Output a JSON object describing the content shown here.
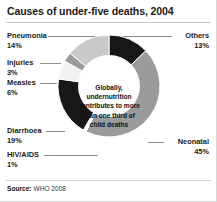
{
  "chart_data": {
    "type": "pie",
    "title": "Causes of under-five deaths, 2004",
    "subtitle": "",
    "xlabel": "",
    "ylabel": "",
    "donut": true,
    "units": "percent",
    "start_angle_deg": 0,
    "direction": "clockwise",
    "center_annotation": "Globally, undernutrition contributes to more than one third of child deaths",
    "categories": [
      "Others",
      "Neonatal",
      "HIV/AIDS",
      "Diarrhoea",
      "Measles",
      "Injuries",
      "Pneumonia"
    ],
    "values": [
      13,
      45,
      1,
      19,
      6,
      3,
      14
    ],
    "slices": [
      {
        "label": "Others",
        "value": 13,
        "value_text": "13%",
        "color": "#17171a"
      },
      {
        "label": "Neonatal",
        "value": 45,
        "value_text": "45%",
        "color": "#9b9b9b"
      },
      {
        "label": "HIV/AIDS",
        "value": 1,
        "value_text": "1%",
        "color": "#fbfbfb"
      },
      {
        "label": "Diarrhoea",
        "value": 19,
        "value_text": "19%",
        "color": "#17171a"
      },
      {
        "label": "Measles",
        "value": 6,
        "value_text": "6%",
        "color": "#f2f2f2"
      },
      {
        "label": "Injuries",
        "value": 3,
        "value_text": "3%",
        "color": "#9b9b9b"
      },
      {
        "label": "Pneumonia",
        "value": 14,
        "value_text": "14%",
        "color": "#c9c9c9"
      }
    ],
    "legend": "callout-labels",
    "grid": false
  },
  "labels": {
    "pneumonia": {
      "name": "Pneumonia",
      "pct": "14%"
    },
    "injuries": {
      "name": "Injuries",
      "pct": "3%"
    },
    "measles": {
      "name": "Measles",
      "pct": "6%"
    },
    "diarrhoea": {
      "name": "Diarrhoea",
      "pct": "19%"
    },
    "hivaids": {
      "name": "HIV/AIDS",
      "pct": "1%"
    },
    "others": {
      "name": "Others",
      "pct": "13%"
    },
    "neonatal": {
      "name": "Neonatal",
      "pct": "45%"
    }
  },
  "source": {
    "prefix": "Source:",
    "text": "WHO 2008"
  }
}
